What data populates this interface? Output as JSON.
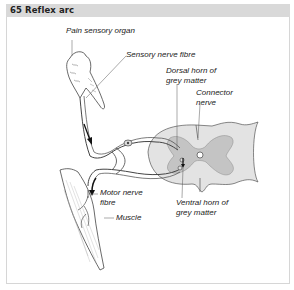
{
  "header": {
    "number": "65",
    "title": "65 Reflex arc"
  },
  "diagram": {
    "labels": {
      "pain_sensory_organ": "Pain sensory organ",
      "sensory_nerve_fibre": "Sensory nerve fibre",
      "dorsal_horn": "Dorsal horn of\ngrey matter",
      "connector_nerve": "Connector\nnerve",
      "motor_nerve_fibre": "Motor nerve\nfibre",
      "ventral_horn": "Ventral horn of\ngrey matter",
      "muscle": "Muscle"
    },
    "colors": {
      "header_bg": "#d9d9d9",
      "white_matter": "#e3e3e3",
      "grey_matter": "#c4c4c4",
      "line": "#444444"
    }
  }
}
